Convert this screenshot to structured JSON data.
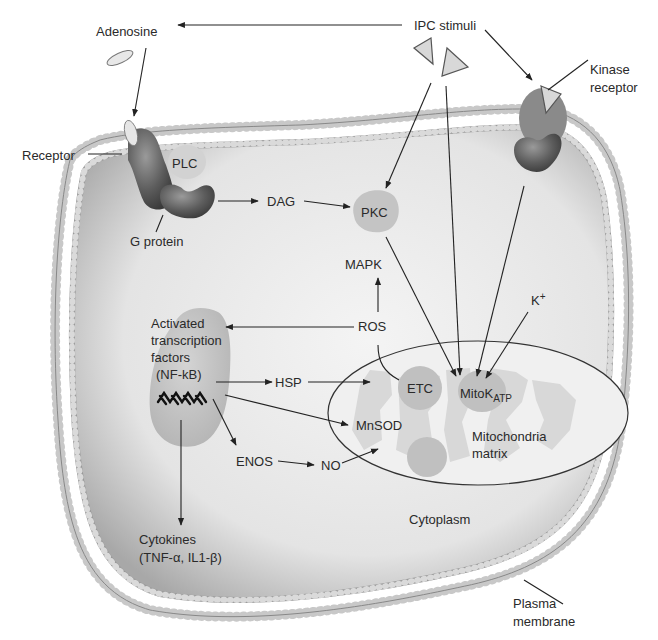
{
  "diagram": {
    "labels": {
      "adenosine": "Adenosine",
      "ipc_stimuli": "IPC stimuli",
      "kinase_receptor_1": "Kinase",
      "kinase_receptor_2": "receptor",
      "receptor": "Receptor",
      "plc": "PLC",
      "g_protein": "G protein",
      "dag": "DAG",
      "pkc": "PKC",
      "mapk": "MAPK",
      "ros": "ROS",
      "k_plus_base": "K",
      "k_plus_sup": "+",
      "activated_tf_1": "Activated",
      "activated_tf_2": "transcription",
      "activated_tf_3": "factors",
      "activated_tf_4": "(NF-kB)",
      "hsp": "HSP",
      "etc": "ETC",
      "mitok_base": "MitoK",
      "mitok_sub": "ATP",
      "mnsod": "MnSOD",
      "enos": "ENOS",
      "no": "NO",
      "mito_matrix_1": "Mitochondria",
      "mito_matrix_2": "matrix",
      "cytokines_1": "Cytokines",
      "cytokines_2": "(TNF-α, IL1-β)",
      "cytoplasm": "Cytoplasm",
      "plasma_membrane_1": "Plasma",
      "plasma_membrane_2": "membrane"
    },
    "edges": [
      {
        "from": "IPC stimuli",
        "to": "Adenosine"
      },
      {
        "from": "IPC stimuli",
        "to": "Kinase receptor"
      },
      {
        "from": "Adenosine",
        "to": "Receptor"
      },
      {
        "from": "G protein",
        "to": "DAG"
      },
      {
        "from": "DAG",
        "to": "PKC"
      },
      {
        "from": "IPC stimuli",
        "to": "PKC"
      },
      {
        "from": "PKC",
        "to": "MitoK ATP"
      },
      {
        "from": "IPC stimuli",
        "to": "MitoK ATP"
      },
      {
        "from": "Kinase receptor",
        "to": "MitoK ATP"
      },
      {
        "from": "K+",
        "to": "MitoK ATP"
      },
      {
        "from": "ETC",
        "to": "ROS"
      },
      {
        "from": "ROS",
        "to": "MAPK"
      },
      {
        "from": "ROS",
        "to": "Activated transcription factors"
      },
      {
        "from": "Activated transcription factors",
        "to": "HSP"
      },
      {
        "from": "HSP",
        "to": "Mitochondria"
      },
      {
        "from": "Activated transcription factors",
        "to": "MnSOD"
      },
      {
        "from": "Activated transcription factors",
        "to": "ENOS"
      },
      {
        "from": "ENOS",
        "to": "NO"
      },
      {
        "from": "NO",
        "to": "Mitochondria"
      },
      {
        "from": "Activated transcription factors",
        "to": "Cytokines"
      }
    ],
    "colors": {
      "background": "#ffffff",
      "cytoplasm": "#e2e2e2",
      "membrane_bead": "#d8d8d8",
      "protein_dark": "#5a5a5a",
      "organelle": "#bdbdbd",
      "line": "#222222"
    }
  }
}
